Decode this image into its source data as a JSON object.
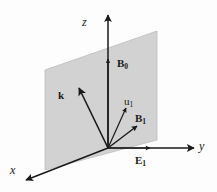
{
  "figure": {
    "background_color": "#fdfdfd",
    "plane_fill_color": "#d2d2d2",
    "plane_stroke_color": "#b4b4b4",
    "line_color": "#1a1a1a"
  },
  "axes": [
    {
      "id": "z",
      "label": "z",
      "label_x": 82,
      "label_y": 16
    },
    {
      "id": "y",
      "label": "y",
      "label_x": 199,
      "label_y": 140
    },
    {
      "id": "x",
      "label": "x",
      "label_x": 10,
      "label_y": 164
    }
  ],
  "vectors": [
    {
      "id": "B0",
      "base": "B",
      "sub": "0",
      "label_x": 117,
      "label_y": 58
    },
    {
      "id": "k",
      "base": "k",
      "sub": "",
      "label_x": 58,
      "label_y": 90
    },
    {
      "id": "u1",
      "base": "u",
      "sub": "1",
      "label_x": 124,
      "label_y": 96
    },
    {
      "id": "B1",
      "base": "B",
      "sub": "1",
      "label_x": 135,
      "label_y": 113
    },
    {
      "id": "E1",
      "base": "E",
      "sub": "1",
      "label_x": 135,
      "label_y": 155
    }
  ],
  "geometry": {
    "origin_x": 108,
    "origin_y": 148,
    "plane_points": "45,70 157,31 157,140 45,170"
  }
}
